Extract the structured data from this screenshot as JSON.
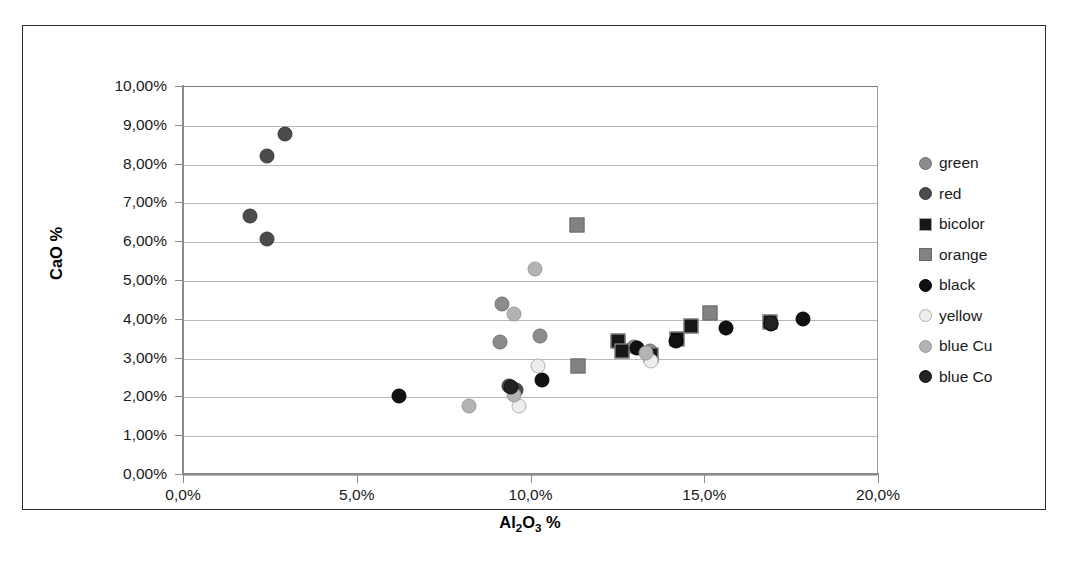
{
  "chart_data": {
    "type": "scatter",
    "title": "",
    "xlabel": "Al2O3 %",
    "ylabel": "CaO %",
    "xlim": [
      0,
      20
    ],
    "ylim": [
      0,
      10
    ],
    "grid": true,
    "legend_position": "right",
    "x_tick_labels": [
      "0,0%",
      "5,0%",
      "10,0%",
      "15,0%",
      "20,0%"
    ],
    "x_tick_values": [
      0,
      5,
      10,
      15,
      20
    ],
    "y_tick_labels": [
      "0,00%",
      "1,00%",
      "2,00%",
      "3,00%",
      "4,00%",
      "5,00%",
      "6,00%",
      "7,00%",
      "8,00%",
      "9,00%",
      "10,00%"
    ],
    "y_tick_values": [
      0,
      1,
      2,
      3,
      4,
      5,
      6,
      7,
      8,
      9,
      10
    ],
    "series": [
      {
        "name": "green",
        "marker": "circle",
        "color": "#8c8c8c",
        "edge": "#6f6f6f",
        "size": 15,
        "points": [
          {
            "x": 9.15,
            "y": 4.42
          },
          {
            "x": 9.1,
            "y": 3.43
          },
          {
            "x": 10.25,
            "y": 3.58
          },
          {
            "x": 13.4,
            "y": 3.2
          },
          {
            "x": 12.95,
            "y": 3.3
          }
        ]
      },
      {
        "name": "red",
        "marker": "circle",
        "color": "#4b4b4b",
        "edge": "#3a3a3a",
        "size": 15,
        "points": [
          {
            "x": 1.9,
            "y": 6.67
          },
          {
            "x": 2.4,
            "y": 6.08
          },
          {
            "x": 2.4,
            "y": 8.22
          },
          {
            "x": 2.9,
            "y": 8.8
          },
          {
            "x": 9.35,
            "y": 2.3
          },
          {
            "x": 9.55,
            "y": 2.18
          }
        ]
      },
      {
        "name": "bicolor",
        "marker": "square",
        "color": "#171717",
        "edge": "#a5a5a5",
        "size": 15,
        "points": [
          {
            "x": 12.5,
            "y": 3.45
          },
          {
            "x": 12.6,
            "y": 3.2
          },
          {
            "x": 13.45,
            "y": 3.1
          },
          {
            "x": 14.2,
            "y": 3.5
          },
          {
            "x": 14.6,
            "y": 3.85
          },
          {
            "x": 16.85,
            "y": 3.95
          }
        ]
      },
      {
        "name": "orange",
        "marker": "square",
        "color": "#828282",
        "edge": "#6a6a6a",
        "size": 15,
        "points": [
          {
            "x": 11.3,
            "y": 6.45
          },
          {
            "x": 11.35,
            "y": 2.8
          },
          {
            "x": 15.15,
            "y": 4.18
          }
        ]
      },
      {
        "name": "black",
        "marker": "circle",
        "color": "#111111",
        "edge": "#000000",
        "size": 15,
        "points": [
          {
            "x": 6.2,
            "y": 2.03
          },
          {
            "x": 10.3,
            "y": 2.45
          },
          {
            "x": 13.05,
            "y": 3.28
          },
          {
            "x": 14.15,
            "y": 3.45
          },
          {
            "x": 16.9,
            "y": 3.9
          },
          {
            "x": 17.8,
            "y": 4.03
          },
          {
            "x": 15.6,
            "y": 3.78
          }
        ]
      },
      {
        "name": "yellow",
        "marker": "circle",
        "color": "#ededed",
        "edge": "#b0b0b0",
        "size": 15,
        "points": [
          {
            "x": 10.2,
            "y": 2.82
          },
          {
            "x": 9.65,
            "y": 1.78
          },
          {
            "x": 13.45,
            "y": 2.95
          }
        ]
      },
      {
        "name": "blue Cu",
        "marker": "circle",
        "color": "#b3b3b3",
        "edge": "#9b9b9b",
        "size": 15,
        "points": [
          {
            "x": 10.1,
            "y": 5.3
          },
          {
            "x": 9.5,
            "y": 4.15
          },
          {
            "x": 8.2,
            "y": 1.78
          },
          {
            "x": 9.5,
            "y": 2.05
          },
          {
            "x": 13.3,
            "y": 3.15
          }
        ]
      },
      {
        "name": "blue Co",
        "marker": "circle",
        "color": "#232323",
        "edge": "#111111",
        "size": 15,
        "points": [
          {
            "x": 9.4,
            "y": 2.28
          },
          {
            "x": 16.9,
            "y": 3.92
          }
        ]
      }
    ]
  },
  "axes": {
    "y_title": "CaO %",
    "x_title_main": "Al",
    "x_title_sub1": "2",
    "x_title_mid": "O",
    "x_title_sub2": "3",
    "x_title_unit": " %"
  },
  "legend": {
    "items": [
      {
        "label": "green",
        "marker": "circle",
        "color": "#8c8c8c",
        "edge": "#6f6f6f"
      },
      {
        "label": "red",
        "marker": "circle",
        "color": "#4b4b4b",
        "edge": "#3a3a3a"
      },
      {
        "label": "bicolor",
        "marker": "square",
        "color": "#171717",
        "edge": "#a5a5a5"
      },
      {
        "label": "orange",
        "marker": "square",
        "color": "#828282",
        "edge": "#6a6a6a"
      },
      {
        "label": "black",
        "marker": "circle",
        "color": "#111111",
        "edge": "#000000"
      },
      {
        "label": "yellow",
        "marker": "circle",
        "color": "#ededed",
        "edge": "#b0b0b0"
      },
      {
        "label": "blue Cu",
        "marker": "circle",
        "color": "#b3b3b3",
        "edge": "#9b9b9b"
      },
      {
        "label": "blue Co",
        "marker": "circle",
        "color": "#232323",
        "edge": "#111111"
      }
    ]
  },
  "caption": {
    "text": ""
  }
}
